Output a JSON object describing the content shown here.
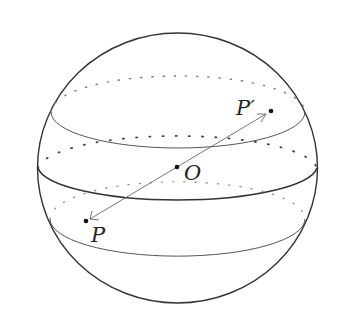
{
  "diagram": {
    "type": "sphere-with-latitude-circles",
    "labels": {
      "center": "O",
      "point": "P",
      "point_prime": "P′"
    },
    "points": {
      "O": {
        "x": 177,
        "y": 167
      },
      "P": {
        "x": 86,
        "y": 221
      },
      "P_prime": {
        "x": 271,
        "y": 111
      }
    },
    "colors": {
      "outline": "#333333",
      "circle": "#555555",
      "dotted": "#666666",
      "arrow": "#666666",
      "background": "#ffffff"
    }
  }
}
